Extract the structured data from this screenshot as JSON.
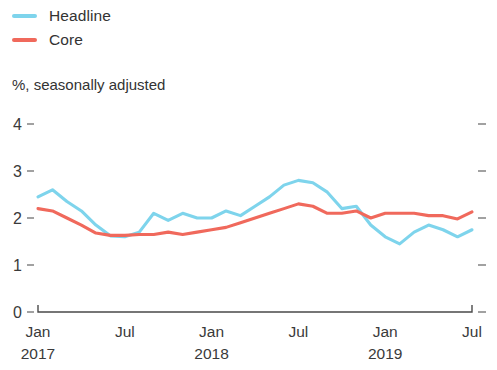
{
  "legend": {
    "position": "top-left",
    "items": [
      {
        "label": "Headline",
        "color": "#7ed4ec"
      },
      {
        "label": "Core",
        "color": "#f0695c"
      }
    ]
  },
  "subtitle": "%, seasonally adjusted",
  "chart_data": {
    "type": "line",
    "title": "",
    "subtitle": "%, seasonally adjusted",
    "xlabel": "",
    "ylabel": "",
    "ylim": [
      0,
      4
    ],
    "yticks": [
      0,
      1,
      2,
      3,
      4
    ],
    "ytick_labels": [
      "0",
      "1",
      "2",
      "3",
      "4"
    ],
    "grid": false,
    "legend_position": "top-left",
    "x_tick_positions": [
      0,
      6,
      12,
      18,
      24,
      30
    ],
    "x_tick_labels": [
      "Jan",
      "Jul",
      "Jan",
      "Jul",
      "Jan",
      "Jul"
    ],
    "x_tick_years": [
      "2017",
      "",
      "2018",
      "",
      "2019",
      ""
    ],
    "x": [
      "2017-01",
      "2017-02",
      "2017-03",
      "2017-04",
      "2017-05",
      "2017-06",
      "2017-07",
      "2017-08",
      "2017-09",
      "2017-10",
      "2017-11",
      "2017-12",
      "2018-01",
      "2018-02",
      "2018-03",
      "2018-04",
      "2018-05",
      "2018-06",
      "2018-07",
      "2018-08",
      "2018-09",
      "2018-10",
      "2018-11",
      "2018-12",
      "2019-01",
      "2019-02",
      "2019-03",
      "2019-04",
      "2019-05",
      "2019-06",
      "2019-07"
    ],
    "series": [
      {
        "name": "Headline",
        "color": "#7ed4ec",
        "values": [
          2.45,
          2.6,
          2.35,
          2.15,
          1.85,
          1.62,
          1.6,
          1.7,
          2.1,
          1.95,
          2.1,
          2.0,
          2.0,
          2.15,
          2.05,
          2.25,
          2.45,
          2.7,
          2.8,
          2.75,
          2.55,
          2.2,
          2.25,
          1.85,
          1.6,
          1.45,
          1.7,
          1.85,
          1.75,
          1.6,
          1.75
        ]
      },
      {
        "name": "Core",
        "color": "#f0695c",
        "values": [
          2.2,
          2.15,
          2.0,
          1.85,
          1.68,
          1.63,
          1.63,
          1.65,
          1.65,
          1.7,
          1.65,
          1.7,
          1.75,
          1.8,
          1.9,
          2.0,
          2.1,
          2.2,
          2.3,
          2.25,
          2.1,
          2.1,
          2.15,
          2.0,
          2.1,
          2.1,
          2.1,
          2.05,
          2.05,
          1.98,
          2.13
        ]
      }
    ]
  }
}
